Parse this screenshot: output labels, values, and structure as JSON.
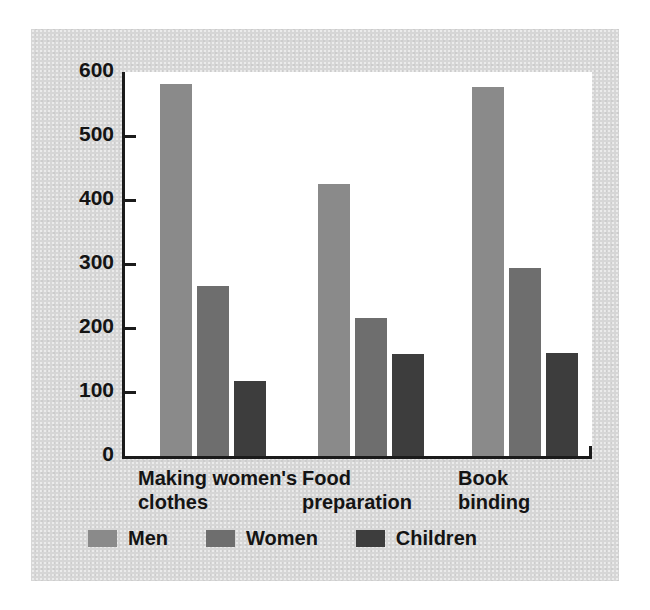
{
  "chart_data": {
    "type": "bar",
    "title": "",
    "subtitle": "",
    "xlabel": "",
    "ylabel": "Annual earnings (in dollars)",
    "categories": [
      "Making women's\nclothes",
      "Food\npreparation",
      "Book\nbinding"
    ],
    "series": [
      {
        "name": "Men",
        "color": "#8a8a8a",
        "values": [
          581,
          425,
          576
        ]
      },
      {
        "name": "Women",
        "color": "#6e6e6e",
        "values": [
          265,
          215,
          293
        ]
      },
      {
        "name": "Children",
        "color": "#3d3d3d",
        "values": [
          117,
          159,
          161
        ]
      }
    ],
    "ylim": [
      0,
      600
    ],
    "yticks": [
      0,
      100,
      200,
      300,
      400,
      500,
      600
    ],
    "ytick_labels": [
      "0",
      "100",
      "200",
      "300",
      "400",
      "500",
      "600"
    ],
    "grid": false,
    "legend_position": "bottom"
  },
  "figure": {
    "panel_color": "#d6d6d6",
    "plot_background": "#ffffff",
    "axis_color": "#1b1b1b",
    "text_color": "#141414"
  }
}
